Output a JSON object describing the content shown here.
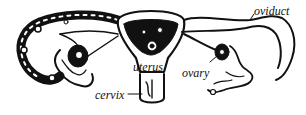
{
  "diagram": {
    "labels": {
      "oviduct": "oviduct",
      "uterus": "uterus",
      "ovary": "ovary",
      "cervix": "cervix"
    },
    "colors": {
      "ink": "#111111",
      "background": "#ffffff"
    }
  }
}
